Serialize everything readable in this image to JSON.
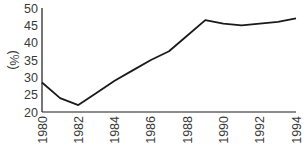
{
  "chart_data": {
    "type": "line",
    "title": "",
    "xlabel": "",
    "ylabel": "(%)",
    "x": [
      1980,
      1981,
      1982,
      1983,
      1984,
      1985,
      1986,
      1987,
      1988,
      1989,
      1990,
      1991,
      1992,
      1993,
      1994
    ],
    "series": [
      {
        "name": "",
        "values": [
          28.5,
          24,
          22,
          25.5,
          29,
          32,
          35,
          37.5,
          42,
          46.5,
          45.5,
          45,
          45.5,
          46,
          47
        ],
        "color": "#1a1a1a"
      }
    ],
    "ylim": [
      20,
      50
    ],
    "xlim": [
      1980,
      1994
    ],
    "yticks": [
      20,
      25,
      30,
      35,
      40,
      45,
      50
    ],
    "xticks": [
      1980,
      1982,
      1984,
      1986,
      1988,
      1990,
      1992,
      1994
    ],
    "grid": false,
    "legend": "none"
  }
}
